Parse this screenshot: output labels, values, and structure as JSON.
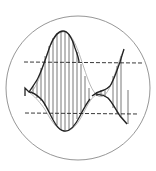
{
  "diagram": {
    "title": "",
    "colors": {
      "stroke": "#222222",
      "light_stroke": "#777777",
      "circle": "#888888",
      "background": "#ffffff"
    },
    "elements": [
      {
        "name": "enclosing-circle",
        "kind": "circle"
      },
      {
        "name": "upper-threshold-line",
        "kind": "dashed-line"
      },
      {
        "name": "lower-threshold-line",
        "kind": "dashed-line"
      },
      {
        "name": "waveform-curve",
        "kind": "curve"
      },
      {
        "name": "envelope-curve",
        "kind": "curve"
      },
      {
        "name": "sample-lines",
        "kind": "vertical-lines",
        "count": 20
      }
    ]
  }
}
